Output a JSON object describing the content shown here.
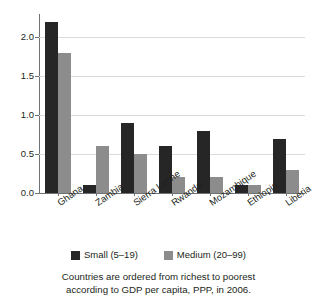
{
  "chart_data": {
    "type": "bar",
    "title": "",
    "subtitle": "",
    "xlabel": "",
    "ylabel": "",
    "ylim": [
      0,
      2.3
    ],
    "yticks": [
      "0.0",
      "0.5",
      "1.0",
      "1.5",
      "2.0"
    ],
    "ytick_values": [
      0.0,
      0.5,
      1.0,
      1.5,
      2.0
    ],
    "grid": true,
    "legend_position": "bottom",
    "categories": [
      "Ghana",
      "Zambia",
      "Sierra Leone",
      "Rwanda",
      "Mozambique",
      "Ethiopia",
      "Liberia"
    ],
    "series": [
      {
        "name": "Small (5–19)",
        "color": "#262626",
        "values": [
          2.2,
          0.1,
          0.9,
          0.6,
          0.8,
          0.1,
          0.7
        ]
      },
      {
        "name": "Medium (20–99)",
        "color": "#8c8c8c",
        "values": [
          1.8,
          0.6,
          0.5,
          0.2,
          0.2,
          0.1,
          0.3
        ]
      }
    ],
    "annotations": [
      "Countries are ordered from richest to poorest",
      "according to GDP per capita, PPP, in 2006."
    ]
  },
  "legend": {
    "items": [
      {
        "label": "Small (5–19)",
        "color": "#262626"
      },
      {
        "label": "Medium (20–99)",
        "color": "#8c8c8c"
      }
    ]
  },
  "caption": {
    "line1": "Countries are ordered from richest to poorest",
    "line2": "according to GDP per capita, PPP, in 2006."
  }
}
